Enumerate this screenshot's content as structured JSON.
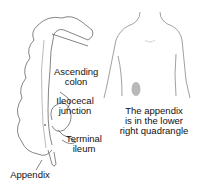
{
  "diagram": {
    "labels": {
      "ascending_colon": "Ascending\ncolon",
      "ileocecal_junction": "Ileocecal\njunction",
      "terminal_ileum": "Terminal\nileum",
      "appendix": "Appendix"
    },
    "caption": "The appendix\nis in the lower\nright quadrangle",
    "colors": {
      "line": "#555555",
      "appendix_highlight": "#b8b8b8",
      "background": "#ffffff"
    }
  }
}
